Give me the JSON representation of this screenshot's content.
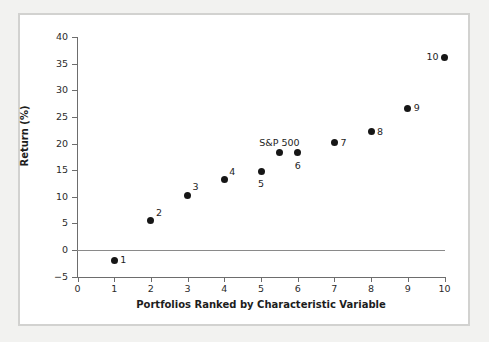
{
  "chart_data": {
    "type": "scatter",
    "title": "",
    "xlabel": "Portfolios Ranked by Characteristic Variable",
    "ylabel": "Return (%)",
    "xlim": [
      0,
      10
    ],
    "ylim": [
      -5,
      40
    ],
    "grid": false,
    "legend": "none",
    "reference_line": {
      "y": 0,
      "color": "#8a8a8a"
    },
    "x_ticks": [
      "0",
      "1",
      "2",
      "3",
      "4",
      "5",
      "6",
      "7",
      "8",
      "9",
      "10"
    ],
    "y_ticks": [
      "−5",
      "0",
      "5",
      "10",
      "15",
      "20",
      "25",
      "30",
      "35",
      "40"
    ],
    "x": [
      1,
      2,
      3,
      4,
      5,
      5.5,
      6,
      7,
      8,
      9,
      10
    ],
    "values": [
      -1.9,
      5.5,
      10.3,
      13.2,
      14.8,
      18.3,
      18.3,
      20.1,
      22.2,
      26.6,
      36.2
    ],
    "points": [
      {
        "label": "1",
        "x": 1,
        "y": -1.9,
        "label_pos": "right"
      },
      {
        "label": "2",
        "x": 2,
        "y": 5.5,
        "label_pos": "upper-right"
      },
      {
        "label": "3",
        "x": 3,
        "y": 10.3,
        "label_pos": "upper-right"
      },
      {
        "label": "4",
        "x": 4,
        "y": 13.2,
        "label_pos": "upper-right"
      },
      {
        "label": "5",
        "x": 5,
        "y": 14.8,
        "label_pos": "below"
      },
      {
        "label": "S&P 500",
        "x": 5.5,
        "y": 18.3,
        "label_pos": "above"
      },
      {
        "label": "6",
        "x": 6,
        "y": 18.3,
        "label_pos": "below"
      },
      {
        "label": "7",
        "x": 7,
        "y": 20.1,
        "label_pos": "right"
      },
      {
        "label": "8",
        "x": 8,
        "y": 22.2,
        "label_pos": "right"
      },
      {
        "label": "9",
        "x": 9,
        "y": 26.6,
        "label_pos": "right"
      },
      {
        "label": "10",
        "x": 10,
        "y": 36.2,
        "label_pos": "left"
      }
    ]
  },
  "colors": {
    "point": "#161616",
    "axis": "#6d6d6d",
    "reference_line": "#8a8a8a",
    "frame_border": "#d2d2d0",
    "page_background": "#f2f2f0",
    "plot_background": "#ffffff",
    "text": "#1d1d1d"
  }
}
